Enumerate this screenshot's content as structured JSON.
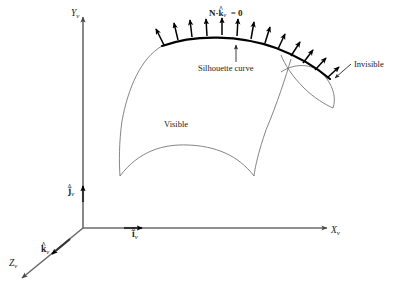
{
  "figure": {
    "background_color": "#ffffff",
    "stroke_color": "#3a3a3a",
    "curve_color": "#555555",
    "silhouette_color": "#000000",
    "arrow_color": "#000000",
    "text_color": "#1a1a1a"
  },
  "axes": {
    "x": {
      "label": "X",
      "subscript": "v",
      "name": "x-axis"
    },
    "y": {
      "label": "Y",
      "subscript": "v",
      "name": "y-axis"
    },
    "z": {
      "label": "Z",
      "subscript": "v",
      "name": "z-axis"
    }
  },
  "unit_vectors": {
    "i": {
      "symbol": "i",
      "hat": "^",
      "subscript": "v"
    },
    "j": {
      "symbol": "j",
      "hat": "^",
      "subscript": "v"
    },
    "k": {
      "symbol": "k",
      "hat": "^",
      "subscript": "v"
    }
  },
  "annotations": {
    "equation": {
      "lhs": "N",
      "dot": "·",
      "vector": "k",
      "hat": "^",
      "subscript": "v",
      "rhs": "= 0"
    },
    "silhouette": "Silhouette curve",
    "invisible": "Invisible",
    "visible": "Visible"
  },
  "normals": {
    "count": 13,
    "description": "surface normal arrows along the silhouette curve"
  }
}
